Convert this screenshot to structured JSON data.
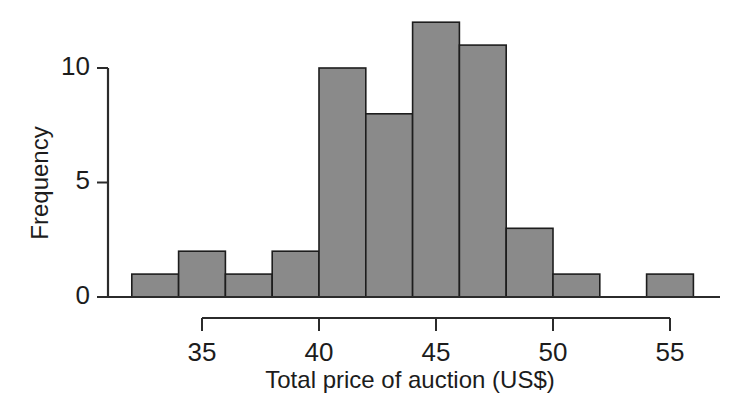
{
  "chart_data": {
    "type": "bar",
    "subtype": "histogram",
    "title": "",
    "subtitle": "",
    "xlabel": "Total price of auction (US$)",
    "ylabel": "Frequency",
    "xlim": [
      32,
      56
    ],
    "ylim": [
      0,
      12
    ],
    "xticks": [
      35,
      40,
      45,
      50,
      55
    ],
    "xtick_labels": [
      "35",
      "40",
      "45",
      "50",
      "55"
    ],
    "yticks": [
      0,
      5,
      10
    ],
    "ytick_labels": [
      "0",
      "5",
      "10"
    ],
    "grid": false,
    "legend": null,
    "bin_width": 2,
    "bin_edges": [
      32,
      34,
      36,
      38,
      40,
      42,
      44,
      46,
      48,
      50,
      52,
      54,
      56
    ],
    "bin_labels": [
      "32-34",
      "34-36",
      "36-38",
      "38-40",
      "40-42",
      "42-44",
      "44-46",
      "46-48",
      "48-50",
      "50-52",
      "52-54",
      "54-56"
    ],
    "values": [
      1,
      2,
      1,
      2,
      10,
      8,
      12,
      11,
      3,
      1,
      0,
      1
    ],
    "total_count": 52,
    "bar_fill": "#8a8a8a",
    "bar_edge": "#1d1d1d",
    "axis_color": "#2b2b2b",
    "background": "#ffffff"
  },
  "axes": {
    "y_axis_title": "Frequency",
    "x_axis_title": "Total price of auction (US$)"
  }
}
